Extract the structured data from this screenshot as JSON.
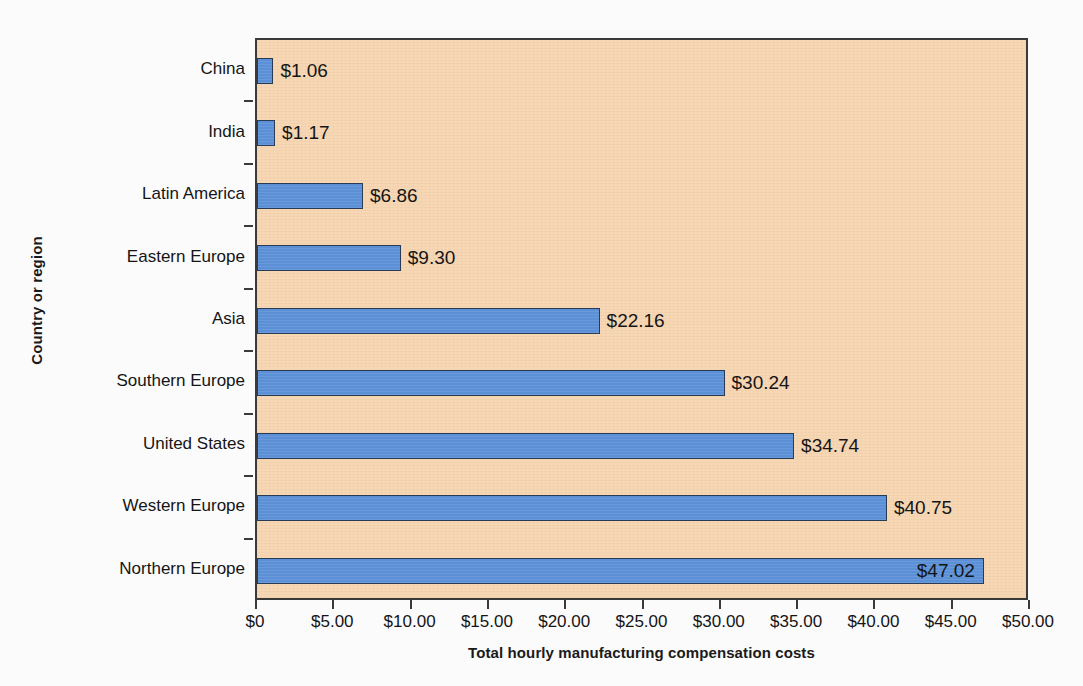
{
  "chart_data": {
    "type": "bar",
    "orientation": "horizontal",
    "title": "",
    "xlabel": "Total hourly manufacturing compensation costs",
    "ylabel": "Country or region",
    "xlim": [
      0,
      50
    ],
    "grid": false,
    "legend": null,
    "currency": "USD",
    "categories": [
      "China",
      "India",
      "Latin America",
      "Eastern Europe",
      "Asia",
      "Southern Europe",
      "United States",
      "Western Europe",
      "Northern Europe"
    ],
    "values": [
      1.06,
      1.17,
      6.86,
      9.3,
      22.16,
      30.24,
      34.74,
      40.75,
      47.02
    ],
    "data_labels": [
      "$1.06",
      "$1.17",
      "$6.86",
      "$9.30",
      "$22.16",
      "$30.24",
      "$34.74",
      "$40.75",
      "$47.02"
    ],
    "label_placement": [
      "outside",
      "outside",
      "outside",
      "outside",
      "outside",
      "outside",
      "outside",
      "outside",
      "inside"
    ],
    "xticks": [
      0,
      5,
      10,
      15,
      20,
      25,
      30,
      35,
      40,
      45,
      50
    ],
    "xtick_labels": [
      "$0",
      "$5.00",
      "$10.00",
      "$15.00",
      "$20.00",
      "$25.00",
      "$30.00",
      "$35.00",
      "$40.00",
      "$45.00",
      "$50.00"
    ],
    "colors": {
      "bar_fill": "#5b8fd6",
      "bar_border": "#2a3b55",
      "plot_background": "#f7d7b4",
      "plot_border": "#3a3a3a",
      "page_background": "#fbfbfc",
      "text": "#151515"
    }
  }
}
